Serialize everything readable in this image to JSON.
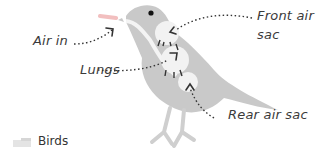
{
  "diagram": {
    "labels": {
      "air_in": "Air in",
      "lungs": "Lungs",
      "front_air_sac": "Front air",
      "front_air_sac_line2": "sac",
      "rear_air_sac": "Rear air sac"
    },
    "caption": "Birds",
    "colors": {
      "bird_body": "#c8c8c8",
      "air_sac": "#f2f2f2",
      "label_text": "#3a3a3a",
      "arrow": "#333333",
      "air_flow": "#e88a8a"
    }
  }
}
